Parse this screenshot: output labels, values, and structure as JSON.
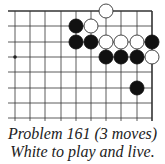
{
  "diagram": {
    "type": "go-problem",
    "grid": {
      "col_x": [
        15,
        30,
        45,
        61,
        76,
        91,
        106,
        121,
        137,
        152
      ],
      "row_y": [
        11,
        26,
        42,
        57,
        72,
        88,
        103,
        118
      ],
      "left_extend_x": 8,
      "bottom_extend_y": 121,
      "top_edge": true,
      "right_edge": true,
      "line_color": "#333333",
      "stone_radius": 7
    },
    "star_points": [
      {
        "col": 0,
        "row": 3
      }
    ],
    "stones": [
      {
        "color": "white",
        "col": 6,
        "row": 0
      },
      {
        "color": "black",
        "col": 4,
        "row": 1
      },
      {
        "color": "white",
        "col": 5,
        "row": 1
      },
      {
        "color": "black",
        "col": 4,
        "row": 2
      },
      {
        "color": "black",
        "col": 5,
        "row": 2
      },
      {
        "color": "white",
        "col": 6,
        "row": 2
      },
      {
        "color": "white",
        "col": 7,
        "row": 2
      },
      {
        "color": "white",
        "col": 8,
        "row": 2
      },
      {
        "color": "black",
        "col": 9,
        "row": 2
      },
      {
        "color": "black",
        "col": 6,
        "row": 3
      },
      {
        "color": "black",
        "col": 7,
        "row": 3
      },
      {
        "color": "black",
        "col": 8,
        "row": 3
      },
      {
        "color": "white",
        "col": 9,
        "row": 3
      },
      {
        "color": "black",
        "col": 8,
        "row": 5
      }
    ]
  },
  "caption": {
    "line1": "Problem 161 (3 moves)",
    "line2": "White to play and live."
  }
}
